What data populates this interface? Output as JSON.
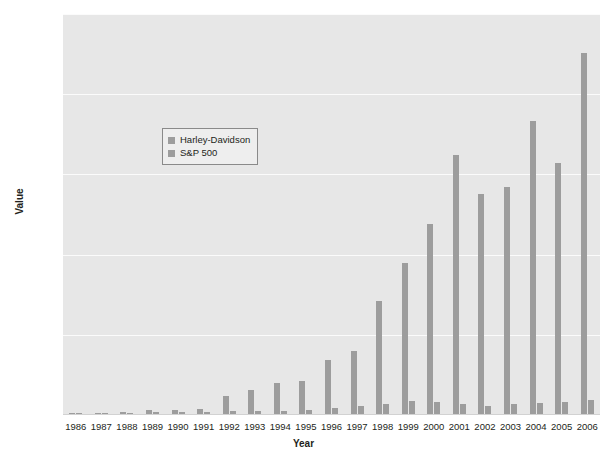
{
  "chart_data": {
    "type": "bar",
    "title": "",
    "xlabel": "Year",
    "ylabel": "Value",
    "ylim": [
      0,
      25000
    ],
    "ytick_values": [
      0,
      5000,
      10000,
      15000,
      20000,
      25000
    ],
    "ytick_labels": [
      "$0",
      "$5,000",
      "$10,000",
      "$15,000",
      "$20,000",
      "$25,000"
    ],
    "grid": true,
    "legend_position": "upper-left-inside",
    "categories": [
      "1986",
      "1987",
      "1988",
      "1989",
      "1990",
      "1991",
      "1992",
      "1993",
      "1994",
      "1995",
      "1996",
      "1997",
      "1998",
      "1999",
      "2000",
      "2001",
      "2002",
      "2003",
      "2004",
      "2005",
      "2006"
    ],
    "series": [
      {
        "name": "Harley-Davidson",
        "color": "#9d9d9d",
        "values": [
          100,
          155,
          200,
          330,
          300,
          380,
          1180,
          1560,
          2000,
          2120,
          3400,
          4020,
          7080,
          9500,
          11900,
          16230,
          13800,
          14200,
          18300,
          15700,
          22600
        ]
      },
      {
        "name": "S&P 500",
        "color": "#9d9d9d",
        "values": [
          100,
          105,
          123,
          162,
          157,
          204,
          220,
          242,
          245,
          337,
          415,
          553,
          711,
          860,
          782,
          689,
          537,
          691,
          766,
          804,
          931
        ]
      }
    ]
  },
  "legend": {
    "items": [
      {
        "label": "Harley-Davidson"
      },
      {
        "label": "S&P 500"
      }
    ]
  },
  "axis": {
    "y_title": "Value",
    "x_title": "Year"
  }
}
